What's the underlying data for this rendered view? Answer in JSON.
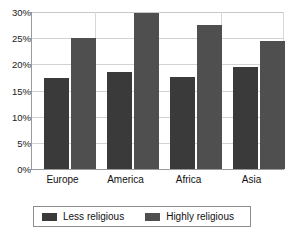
{
  "chart_data": {
    "type": "bar",
    "title": "",
    "subtitle": "",
    "xlabel": "",
    "ylabel": "",
    "categories": [
      "Europe",
      "America",
      "Africa",
      "Asia"
    ],
    "series": [
      {
        "name": "Less religious",
        "color": "#3a3a3a",
        "values": [
          17.4,
          18.6,
          17.6,
          19.5
        ]
      },
      {
        "name": "Highly religious",
        "color": "#4f4f4f",
        "values": [
          25.0,
          29.8,
          27.5,
          24.5
        ]
      }
    ],
    "ylim": [
      0,
      30
    ],
    "yticks": [
      0,
      5,
      10,
      15,
      20,
      25,
      30
    ],
    "ytick_labels": [
      "0%",
      "5%",
      "10%",
      "15%",
      "20%",
      "25%",
      "30%"
    ],
    "grid": true,
    "grid_axis": "y",
    "legend_position": "bottom",
    "value_format": "percent"
  },
  "axis": {
    "y_labels": [
      "30%",
      "25%",
      "20%",
      "15%",
      "10%",
      "5%",
      "0%"
    ],
    "x_labels": [
      "Europe",
      "America",
      "Africa",
      "Asia"
    ]
  },
  "legend": {
    "entries": [
      {
        "label": "Less religious",
        "color": "#3a3a3a"
      },
      {
        "label": "Highly religious",
        "color": "#4f4f4f"
      }
    ]
  },
  "colors": {
    "less_religious": "#3a3a3a",
    "highly_religious": "#4f4f4f",
    "gridline": "#d2d2d2",
    "axis": "#9a9a9a",
    "background": "#ffffff",
    "text": "#111111"
  }
}
